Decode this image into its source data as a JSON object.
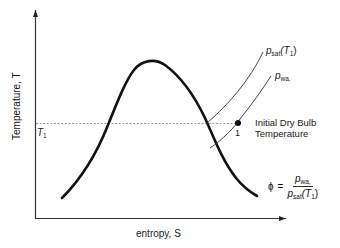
{
  "diagram": {
    "axes": {
      "y_label": "Temperature, T",
      "x_label": "entropy, S"
    },
    "reference_line": {
      "label": "T1",
      "style": "dashed"
    },
    "curves": [
      {
        "id": "saturation-dome",
        "label": ""
      },
      {
        "id": "psat-isobar",
        "label": "p_sat(T1)",
        "base": "p",
        "sub": "sat",
        "arg": "(T",
        "arg_sub": "1",
        "arg_close": ")"
      },
      {
        "id": "pwa-isobar",
        "label": "p_wa,",
        "base": "p",
        "sub": "wa,",
        "sub2": "i"
      }
    ],
    "point": {
      "label": "1"
    },
    "annotation": {
      "line1": "Initial Dry Bulb",
      "line2": "Temperature"
    },
    "formula": {
      "lhs": "ϕ",
      "eq": "=",
      "num_base": "p",
      "num_sub": "wa,",
      "den_base": "p",
      "den_sub": "sat",
      "den_arg": "(T",
      "den_arg_sub": "1",
      "den_arg_close": ")"
    },
    "colors": {
      "line": "#111111",
      "thin_line": "#333333",
      "dashed": "#888888",
      "background": "#ffffff"
    }
  }
}
